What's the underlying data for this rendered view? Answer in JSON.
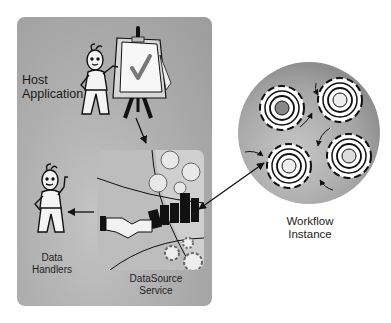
{
  "diagram": {
    "title": "",
    "nodes": [
      {
        "id": "host",
        "label": "Host Application",
        "lines": [
          "Host",
          "Application"
        ]
      },
      {
        "id": "handlers",
        "label": "Data Handlers",
        "lines": [
          "Data",
          "Handlers"
        ]
      },
      {
        "id": "datasource",
        "label": "DataSource Service",
        "lines": [
          "DataSource",
          "Service"
        ]
      },
      {
        "id": "workflow",
        "label": "Workflow Instance",
        "lines": [
          "Workflow",
          "Instance"
        ]
      }
    ],
    "edges": [
      {
        "from": "host",
        "to": "datasource",
        "direction": "one-way"
      },
      {
        "from": "datasource",
        "to": "handlers",
        "direction": "one-way"
      },
      {
        "from": "datasource",
        "to": "workflow",
        "direction": "two-way"
      }
    ],
    "icons": {
      "host": "presenter-with-checkmark-easel-icon",
      "handlers": "waving-stick-figure-icon",
      "datasource": "handshake-city-globe-icon",
      "workflow": "four-gears-with-faces-icon"
    }
  },
  "colors": {
    "panel": "#b0b0b0",
    "circle": "#a8a8a8",
    "text": "#222222",
    "stroke": "#111111"
  }
}
